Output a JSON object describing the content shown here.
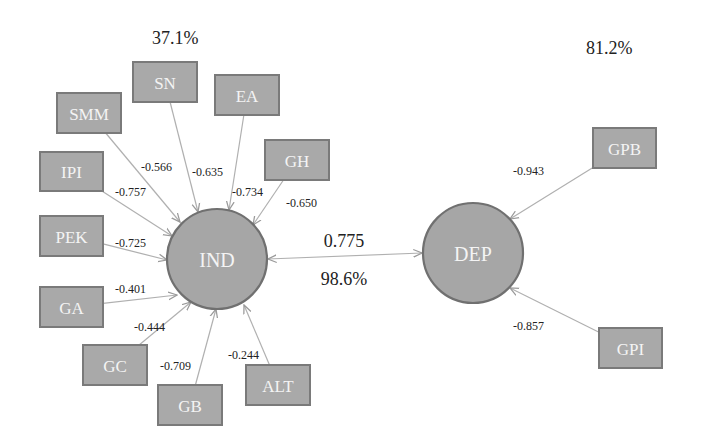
{
  "diagram": {
    "type": "structural-equation-model",
    "constructs": [
      {
        "id": "IND",
        "label": "IND",
        "cx": 217,
        "cy": 259,
        "r": 50,
        "r_squared": "37.1%",
        "r2_x": 152,
        "r2_y": 44
      },
      {
        "id": "DEP",
        "label": "DEP",
        "cx": 473,
        "cy": 253,
        "r": 50,
        "r_squared": "81.2%",
        "r2_x": 586,
        "r2_y": 54
      }
    ],
    "indicators": [
      {
        "id": "SN",
        "label": "SN",
        "construct": "IND",
        "x": 133,
        "y": 62,
        "w": 64,
        "h": 40,
        "loading": "-0.566",
        "lx": 141,
        "ly": 171,
        "ax": 198,
        "ay": 212
      },
      {
        "id": "EA",
        "label": "EA",
        "construct": "IND",
        "x": 215,
        "y": 75,
        "w": 64,
        "h": 40,
        "loading": "-0.635",
        "lx": 192,
        "ly": 176,
        "ax": 229,
        "ay": 210
      },
      {
        "id": "SMM",
        "label": "SMM",
        "construct": "IND",
        "x": 57,
        "y": 93,
        "w": 64,
        "h": 40,
        "loading": "-0.566",
        "lx": 141,
        "ly": 171,
        "ax": 180,
        "ay": 222
      },
      {
        "id": "GH",
        "label": "GH",
        "construct": "IND",
        "x": 265,
        "y": 140,
        "w": 64,
        "h": 40,
        "loading": "-0.734",
        "lx": 234,
        "ly": 196,
        "ax": 253,
        "ay": 225
      },
      {
        "id": "IPI",
        "label": "IPI",
        "construct": "IND",
        "x": 40,
        "y": 152,
        "w": 63,
        "h": 39,
        "loading": "-0.757",
        "lx": 115,
        "ly": 196,
        "ax": 172,
        "ay": 236
      },
      {
        "id": "PEK",
        "label": "PEK",
        "construct": "IND",
        "x": 40,
        "y": 216,
        "w": 63,
        "h": 40,
        "loading": "-0.725",
        "lx": 115,
        "ly": 247,
        "ax": 167,
        "ay": 260
      },
      {
        "id": "GA",
        "label": "GA",
        "construct": "IND",
        "x": 40,
        "y": 287,
        "w": 63,
        "h": 40,
        "loading": "-0.401",
        "lx": 115,
        "ly": 293,
        "ax": 177,
        "ay": 295
      },
      {
        "id": "GC",
        "label": "GC",
        "construct": "IND",
        "x": 83,
        "y": 345,
        "w": 64,
        "h": 40,
        "loading": "-0.444",
        "lx": 134,
        "ly": 331,
        "ax": 191,
        "ay": 302
      },
      {
        "id": "GB",
        "label": "GB",
        "construct": "IND",
        "x": 158,
        "y": 385,
        "w": 64,
        "h": 40,
        "loading": "-0.709",
        "lx": 160,
        "ly": 370,
        "ax": 216,
        "ay": 309
      },
      {
        "id": "ALT",
        "label": "ALT",
        "construct": "IND",
        "x": 246,
        "y": 365,
        "w": 64,
        "h": 40,
        "loading": "-0.244",
        "lx": 228,
        "ly": 359,
        "ax": 244,
        "ay": 305
      },
      {
        "id": "GPB",
        "label": "GPB",
        "construct": "DEP",
        "x": 593,
        "y": 128,
        "w": 63,
        "h": 40,
        "loading": "-0.943",
        "lx": 513,
        "ly": 175,
        "ax": 510,
        "ay": 219
      },
      {
        "id": "GPI",
        "label": "GPI",
        "construct": "DEP",
        "x": 599,
        "y": 328,
        "w": 63,
        "h": 40,
        "loading": "-0.857",
        "lx": 513,
        "ly": 330,
        "ax": 510,
        "ay": 288
      }
    ],
    "path": {
      "from": "IND",
      "to": "DEP",
      "bidirectional": true,
      "coefficient": "0.775",
      "coef_x": 344,
      "coef_y": 247,
      "percent": "98.6%",
      "pct_x": 344,
      "pct_y": 285
    },
    "colors": {
      "node_fill": "#a6a6a6",
      "node_stroke": "#707070",
      "edge": "#b0b0b0",
      "label_text": "#f4f4f4",
      "value_text": "#222222"
    }
  }
}
